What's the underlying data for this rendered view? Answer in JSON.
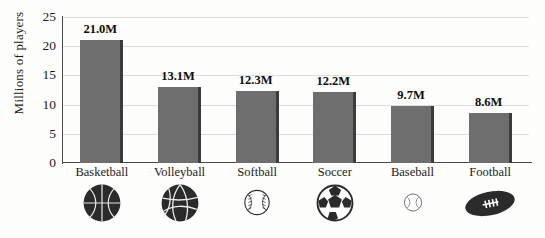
{
  "chart_data": {
    "type": "bar",
    "title": "",
    "xlabel": "",
    "ylabel": "Millions of players",
    "ylim": [
      0,
      25
    ],
    "yticks": [
      0,
      5,
      10,
      15,
      20,
      25
    ],
    "ytick_labels": [
      "0",
      "5",
      "10",
      "15",
      "20",
      "25"
    ],
    "grid": true,
    "legend": "none",
    "categories": [
      "Basketball",
      "Volleyball",
      "Softball",
      "Soccer",
      "Baseball",
      "Football"
    ],
    "values": [
      21.0,
      13.1,
      12.3,
      12.2,
      9.7,
      8.6
    ],
    "data_labels": [
      "21.0M",
      "13.1M",
      "12.3M",
      "12.2M",
      "9.7M",
      "8.6M"
    ],
    "icons": [
      "basketball-icon",
      "volleyball-icon",
      "softball-icon",
      "soccer-ball-icon",
      "baseball-icon",
      "football-icon"
    ],
    "colors": {
      "bar_fill": "#6e6e6e",
      "bar_edge": "#3b3b3b",
      "gridline": "#dcdcdc",
      "axis": "#4a4a4a",
      "text": "#1b1b1b",
      "background": "#fdfdfb"
    }
  }
}
